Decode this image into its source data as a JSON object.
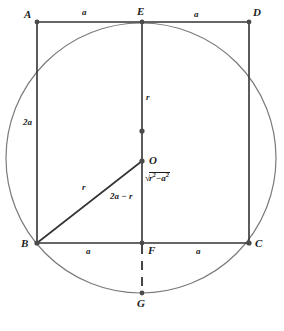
{
  "figure": {
    "type": "geometry-diagram",
    "colors": {
      "stroke": "#333333",
      "circle": "#6b6b6b",
      "background": "#ffffff",
      "label": "#1c1c1c"
    },
    "points": [
      {
        "id": "A",
        "label": "A",
        "x": 37,
        "y": 22,
        "label_x": 24,
        "label_y": 9,
        "marker": true
      },
      {
        "id": "E",
        "label": "E",
        "x": 142,
        "y": 22,
        "label_x": 137,
        "label_y": 7,
        "marker": true
      },
      {
        "id": "D",
        "label": "D",
        "x": 249,
        "y": 22,
        "label_x": 253,
        "label_y": 8,
        "marker": true
      },
      {
        "id": "T",
        "label": "",
        "x": 142,
        "y": 131,
        "label_x": 0,
        "label_y": 0,
        "marker": true
      },
      {
        "id": "O",
        "label": "O",
        "x": 142,
        "y": 161,
        "label_x": 149,
        "label_y": 157,
        "marker": true
      },
      {
        "id": "B",
        "label": "B",
        "x": 37,
        "y": 243,
        "label_x": 22,
        "label_y": 243,
        "marker": true
      },
      {
        "id": "F",
        "label": "F",
        "x": 142,
        "y": 243,
        "label_x": 148,
        "label_y": 247,
        "marker": true
      },
      {
        "id": "C",
        "label": "C",
        "x": 249,
        "y": 243,
        "label_x": 255,
        "label_y": 243,
        "marker": true
      },
      {
        "id": "G",
        "label": "G",
        "x": 142,
        "y": 293,
        "label_x": 137,
        "label_y": 300,
        "marker": true
      }
    ],
    "circle": {
      "cx": 141,
      "cy": 158,
      "r": 135
    },
    "segments": [
      {
        "name": "side-AD-top-left",
        "from": "A",
        "to": "E",
        "style": "solid"
      },
      {
        "name": "side-AD-top-right",
        "from": "E",
        "to": "D",
        "style": "solid"
      },
      {
        "name": "side-AB-left",
        "from": "A",
        "to": "B",
        "style": "solid"
      },
      {
        "name": "side-DC-right",
        "from": "D",
        "to": "C",
        "style": "solid"
      },
      {
        "name": "side-BC-bottom-left",
        "from": "B",
        "to": "F",
        "style": "solid"
      },
      {
        "name": "side-BC-bottom-right",
        "from": "F",
        "to": "C",
        "style": "solid"
      },
      {
        "name": "median-EF",
        "from": "E",
        "to": "F",
        "style": "solid"
      },
      {
        "name": "radius-OB",
        "from": "O",
        "to": "B",
        "style": "solid"
      },
      {
        "name": "extension-FG",
        "from": "F",
        "to": "G",
        "style": "dashed"
      }
    ],
    "measure_labels": [
      {
        "name": "top-left-a",
        "text": "a",
        "x": 84,
        "y": 9,
        "kind": "plain"
      },
      {
        "name": "top-right-a",
        "text": "a",
        "x": 196,
        "y": 11,
        "kind": "plain"
      },
      {
        "name": "left-side-2a",
        "text": "2a",
        "x": 25,
        "y": 121,
        "kind": "plain"
      },
      {
        "name": "median-upper-r",
        "text": "r",
        "x": 147,
        "y": 96,
        "kind": "plain"
      },
      {
        "name": "diagonal-r",
        "text": "r",
        "x": 84,
        "y": 186,
        "kind": "plain"
      },
      {
        "name": "median-lower",
        "text": "2a − r",
        "x": 113,
        "y": 195,
        "kind": "plain"
      },
      {
        "name": "bottom-left-a",
        "text": "a",
        "x": 88,
        "y": 249,
        "kind": "plain"
      },
      {
        "name": "bottom-right-a",
        "text": "a",
        "x": 198,
        "y": 249,
        "kind": "plain"
      }
    ],
    "radical_label": {
      "name": "chord-half-length",
      "text": "√r² − a²",
      "radical_sign": "√",
      "base1": "r",
      "exp1": "2",
      "operator": "−",
      "base2": "a",
      "exp2": "2",
      "x": 145,
      "y": 178
    }
  }
}
